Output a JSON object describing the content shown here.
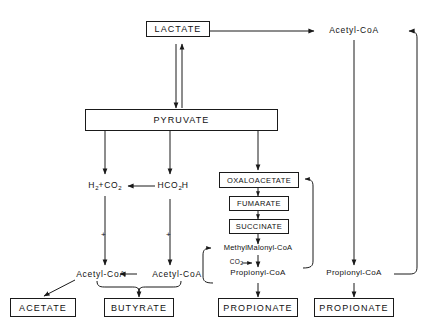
{
  "diagram": {
    "type": "metabolic-pathway-flowchart",
    "background_color": "#ffffff",
    "line_color": "#1a1a1a",
    "text_color": "#111111"
  },
  "nodes": {
    "lactate": {
      "label": "LACTATE",
      "boxed": true
    },
    "pyruvate": {
      "label": "PYRUVATE",
      "boxed": true
    },
    "acetyl_coa_top_right": {
      "label": "Acetyl-CoA",
      "boxed": false
    },
    "h2_co2": {
      "label_main": "H",
      "sub1": "2",
      "plus": "+CO",
      "sub2": "2",
      "boxed": false
    },
    "hco2h": {
      "label_main": "HCO",
      "sub1": "2",
      "tail": "H",
      "boxed": false
    },
    "oxaloacetate": {
      "label": "OXALOACETATE",
      "boxed": true
    },
    "fumarate": {
      "label": "FUMARATE",
      "boxed": true
    },
    "succinate": {
      "label": "SUCCINATE",
      "boxed": true
    },
    "methylmalonyl_coa": {
      "label": "MethylMalonyl-CoA",
      "boxed": false
    },
    "co2_release": {
      "label_main": "CO",
      "sub": "2",
      "boxed": false
    },
    "propionyl_coa_center": {
      "label": "Propionyl-CoA",
      "boxed": false
    },
    "propionyl_coa_right": {
      "label": "Propionyl-CoA",
      "boxed": false
    },
    "acetyl_coa_left": {
      "label": "Acetyl-CoA",
      "boxed": false
    },
    "acetyl_coa_mid": {
      "label": "Acetyl-CoA",
      "boxed": false
    },
    "acetate": {
      "label": "ACETATE",
      "boxed": true
    },
    "butyrate": {
      "label": "BUTYRATE",
      "boxed": true
    },
    "propionate_center": {
      "label": "PROPIONATE",
      "boxed": true
    },
    "propionate_right": {
      "label": "PROPIONATE",
      "boxed": true
    }
  },
  "markers": {
    "plus_left": "+",
    "plus_right": "+"
  },
  "edges": [
    {
      "from": "lactate",
      "to": "acetyl_coa_top_right",
      "style": "straight-horizontal-arrow"
    },
    {
      "from": "pyruvate",
      "to": "lactate",
      "style": "vertical-arrow-up"
    },
    {
      "from": "lactate",
      "to": "pyruvate",
      "style": "vertical-arrow-down"
    },
    {
      "from": "pyruvate",
      "to": "h2_co2",
      "style": "vertical-arrow-down"
    },
    {
      "from": "pyruvate",
      "to": "hco2h",
      "style": "vertical-arrow-down"
    },
    {
      "from": "pyruvate",
      "to": "oxaloacetate",
      "style": "vertical-arrow-down"
    },
    {
      "from": "hco2h",
      "to": "h2_co2",
      "style": "horizontal-arrow-left"
    },
    {
      "from": "h2_co2",
      "to": "acetyl_coa_left",
      "style": "vertical-arrow-down"
    },
    {
      "from": "hco2h",
      "to": "acetyl_coa_mid",
      "style": "vertical-arrow-down"
    },
    {
      "from": "acetyl_coa_mid",
      "to": "acetyl_coa_left",
      "style": "horizontal-arrow-left"
    },
    {
      "from": "acetyl_coa_left",
      "to": "acetate",
      "style": "diagonal-arrow"
    },
    {
      "from": "acetyl_coa_pair",
      "to": "butyrate",
      "style": "brace-arrow-down"
    },
    {
      "from": "oxaloacetate",
      "to": "fumarate",
      "style": "vertical-arrow-down"
    },
    {
      "from": "fumarate",
      "to": "succinate",
      "style": "vertical-arrow-down"
    },
    {
      "from": "succinate",
      "to": "methylmalonyl_coa",
      "style": "vertical-arrow-down"
    },
    {
      "from": "methylmalonyl_coa",
      "to": "propionyl_coa_center",
      "style": "vertical-arrow-down"
    },
    {
      "from": "propionyl_coa_center",
      "to": "methylmalonyl_coa",
      "style": "left-loop-arrow"
    },
    {
      "from": "methylmalonyl_coa",
      "to": "oxaloacetate",
      "style": "right-loop-arrow"
    },
    {
      "from": "propionyl_coa_center",
      "to": "propionate_center",
      "style": "vertical-arrow-down"
    },
    {
      "from": "acetyl_coa_top_right",
      "to": "propionyl_coa_right",
      "style": "vertical-arrow-down"
    },
    {
      "from": "propionyl_coa_right",
      "to": "acetyl_coa_top_right",
      "style": "right-return-loop-arrow"
    },
    {
      "from": "propionyl_coa_right",
      "to": "propionate_right",
      "style": "vertical-arrow-down"
    }
  ]
}
